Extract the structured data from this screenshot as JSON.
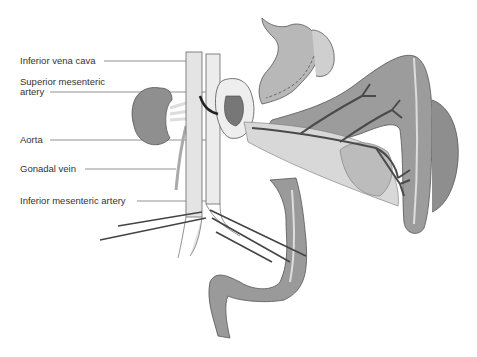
{
  "diagram": {
    "labels": [
      {
        "id": "ivc",
        "text": "Inferior vena cava"
      },
      {
        "id": "sma_1",
        "text": "Superior mesenteric"
      },
      {
        "id": "sma_2",
        "text": "artery"
      },
      {
        "id": "aorta",
        "text": "Aorta"
      },
      {
        "id": "gonadal",
        "text": "Gonadal vein"
      },
      {
        "id": "ima",
        "text": "Inferior mesenteric artery"
      }
    ],
    "colors": {
      "organ_dark": "#8c8c8c",
      "organ_mid": "#a8a8a8",
      "organ_light": "#d6d6d6",
      "vessel": "#e6e6e6",
      "outline": "#555555",
      "artery": "#5a5a5a",
      "leader": "#666666"
    }
  }
}
